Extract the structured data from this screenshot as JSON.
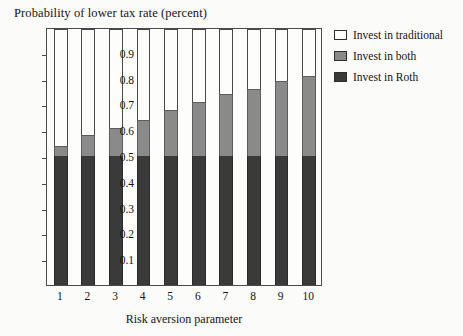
{
  "chart_data": {
    "type": "bar",
    "title": "Probability of lower tax rate (percent)",
    "xlabel": "Risk aversion parameter",
    "ylabel": "",
    "stacked": true,
    "grid": false,
    "legend_position": "right",
    "categories": [
      "1",
      "2",
      "3",
      "4",
      "5",
      "6",
      "7",
      "8",
      "9",
      "10"
    ],
    "ylim": [
      0,
      1
    ],
    "yticks": [
      "0.1",
      "0.2",
      "0.3",
      "0.4",
      "0.5",
      "0.6",
      "0.7",
      "0.8",
      "0.9"
    ],
    "ytick_values": [
      0.1,
      0.2,
      0.3,
      0.4,
      0.5,
      0.6,
      0.7,
      0.8,
      0.9
    ],
    "series": [
      {
        "name": "Invest in Roth",
        "color": "#3a3a3a",
        "values": [
          0.5,
          0.5,
          0.5,
          0.5,
          0.5,
          0.5,
          0.5,
          0.5,
          0.5,
          0.5
        ]
      },
      {
        "name": "Invest in both",
        "color": "#8a8a8a",
        "values": [
          0.04,
          0.08,
          0.11,
          0.14,
          0.18,
          0.21,
          0.24,
          0.26,
          0.29,
          0.31
        ]
      },
      {
        "name": "Invest in traditional",
        "color": "#fdfdfb",
        "values": [
          0.46,
          0.42,
          0.39,
          0.36,
          0.32,
          0.29,
          0.26,
          0.24,
          0.21,
          0.19
        ]
      }
    ],
    "cumulative_tops": {
      "roth": [
        0.5,
        0.5,
        0.5,
        0.5,
        0.5,
        0.5,
        0.5,
        0.5,
        0.5,
        0.5
      ],
      "both": [
        0.54,
        0.58,
        0.61,
        0.64,
        0.68,
        0.71,
        0.74,
        0.76,
        0.79,
        0.81
      ]
    }
  },
  "legend": {
    "items": [
      {
        "label": "Invest in traditional",
        "color": "#fdfdfb"
      },
      {
        "label": "Invest in both",
        "color": "#8a8a8a"
      },
      {
        "label": "Invest in Roth",
        "color": "#3a3a3a"
      }
    ]
  },
  "colors": {
    "background": "#fbfbf9",
    "plot_background": "#fdfdfb",
    "frame": "#4a4a4a",
    "text": "#141414",
    "roth": "#3a3a3a",
    "both": "#8a8a8a",
    "traditional": "#fdfdfb"
  }
}
